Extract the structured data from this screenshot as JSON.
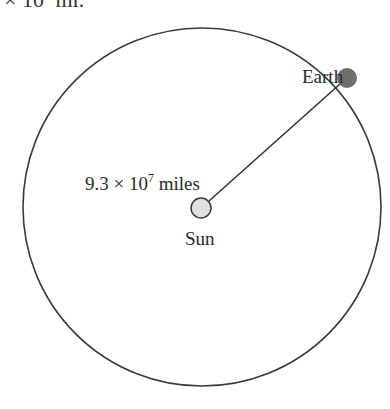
{
  "header_fragment": {
    "prefix": "× 10",
    "exponent": "8",
    "suffix": " mi."
  },
  "diagram": {
    "orbit": {
      "cx": 202,
      "cy": 207,
      "r": 179,
      "stroke": "#3a3a3a"
    },
    "sun": {
      "label": "Sun",
      "cx": 201,
      "cy": 208,
      "r": 10,
      "fill": "#e0e0e0",
      "stroke": "#3a3a3a"
    },
    "earth": {
      "label": "Earth",
      "cx": 347,
      "cy": 78,
      "r": 10,
      "fill": "#6e6e6e"
    },
    "radius_line": {
      "x1": 209,
      "y1": 201,
      "x2": 340,
      "y2": 84
    },
    "distance_label": {
      "mantissa": "9.3 × 10",
      "exponent": "7",
      "unit": " miles"
    }
  }
}
